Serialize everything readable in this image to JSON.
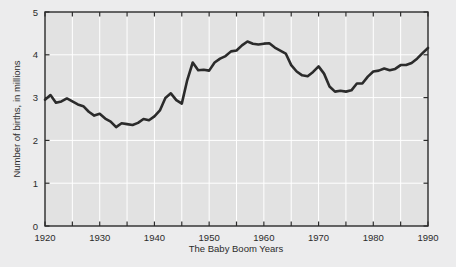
{
  "chart_data": {
    "type": "line",
    "title": "",
    "xlabel": "The Baby Boom Years",
    "ylabel": "Number of births, in millions",
    "xlim": [
      1920,
      1990
    ],
    "ylim": [
      0,
      5
    ],
    "grid": true,
    "legend": "none",
    "x_ticks_major": [
      1920,
      1930,
      1940,
      1950,
      1960,
      1970,
      1980,
      1990
    ],
    "x_tick_labels": [
      "1920",
      "1930",
      "1940",
      "1950",
      "1960",
      "1970",
      "1980",
      "1990"
    ],
    "x_ticks_minor": [
      1925,
      1935,
      1945,
      1955,
      1965,
      1975,
      1985
    ],
    "y_ticks": [
      0,
      1,
      2,
      3,
      4,
      5
    ],
    "y_tick_labels": [
      "0",
      "1",
      "2",
      "3",
      "4",
      "5"
    ],
    "line_color": "#2b2b2b",
    "line_width": 2.6,
    "plot_bg": "#e2e2e2",
    "grid_color": "#ffffff",
    "frame_color": "#2b2b2b",
    "figure_bg": "#ececed",
    "series": [
      {
        "name": "Number of births",
        "x": [
          1920,
          1921,
          1922,
          1923,
          1924,
          1925,
          1926,
          1927,
          1928,
          1929,
          1930,
          1931,
          1932,
          1933,
          1934,
          1935,
          1936,
          1937,
          1938,
          1939,
          1940,
          1941,
          1942,
          1943,
          1944,
          1945,
          1946,
          1947,
          1948,
          1949,
          1950,
          1951,
          1952,
          1953,
          1954,
          1955,
          1956,
          1957,
          1958,
          1959,
          1960,
          1961,
          1962,
          1963,
          1964,
          1965,
          1966,
          1967,
          1968,
          1969,
          1970,
          1971,
          1972,
          1973,
          1974,
          1975,
          1976,
          1977,
          1978,
          1979,
          1980,
          1981,
          1982,
          1983,
          1984,
          1985,
          1986,
          1987,
          1988,
          1989,
          1990
        ],
        "values": [
          2.95,
          3.06,
          2.88,
          2.91,
          2.98,
          2.91,
          2.84,
          2.8,
          2.67,
          2.58,
          2.62,
          2.51,
          2.44,
          2.31,
          2.4,
          2.38,
          2.36,
          2.41,
          2.5,
          2.47,
          2.56,
          2.7,
          2.99,
          3.1,
          2.94,
          2.86,
          3.41,
          3.82,
          3.64,
          3.65,
          3.63,
          3.82,
          3.91,
          3.97,
          4.08,
          4.1,
          4.22,
          4.31,
          4.26,
          4.24,
          4.26,
          4.27,
          4.17,
          4.1,
          4.03,
          3.76,
          3.61,
          3.52,
          3.5,
          3.6,
          3.73,
          3.56,
          3.26,
          3.14,
          3.16,
          3.14,
          3.17,
          3.33,
          3.33,
          3.49,
          3.61,
          3.63,
          3.68,
          3.64,
          3.67,
          3.76,
          3.76,
          3.81,
          3.91,
          4.04,
          4.16
        ]
      }
    ]
  },
  "axes": {
    "y_label": "Number of births, in millions",
    "x_label": "The Baby Boom Years"
  }
}
